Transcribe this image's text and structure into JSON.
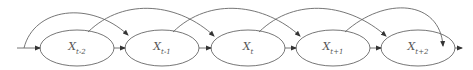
{
  "diagram": {
    "type": "markov-chain-second-order",
    "stroke_color": "#555555",
    "nodes": [
      {
        "id": "x_t_minus_2",
        "base": "X",
        "sub": "t-2",
        "cx": 77,
        "cy": 48
      },
      {
        "id": "x_t_minus_1",
        "base": "X",
        "sub": "t-1",
        "cx": 162,
        "cy": 48
      },
      {
        "id": "x_t",
        "base": "X",
        "sub": "t",
        "cx": 248,
        "cy": 48
      },
      {
        "id": "x_t_plus_1",
        "base": "X",
        "sub": "t+1",
        "cx": 333,
        "cy": 48
      },
      {
        "id": "x_t_plus_2",
        "base": "X",
        "sub": "t+2",
        "cx": 418,
        "cy": 48
      }
    ],
    "edges": [
      {
        "from": "start",
        "to": "x_t_minus_2",
        "kind": "sequential"
      },
      {
        "from": "x_t_minus_2",
        "to": "x_t_minus_1",
        "kind": "sequential"
      },
      {
        "from": "x_t_minus_1",
        "to": "x_t",
        "kind": "sequential"
      },
      {
        "from": "x_t",
        "to": "x_t_plus_1",
        "kind": "sequential"
      },
      {
        "from": "x_t_plus_1",
        "to": "x_t_plus_2",
        "kind": "sequential"
      },
      {
        "from": "x_t_plus_2",
        "to": "end",
        "kind": "sequential"
      },
      {
        "from": "start",
        "to": "x_t_minus_1",
        "kind": "skip"
      },
      {
        "from": "x_t_minus_2",
        "to": "x_t",
        "kind": "skip"
      },
      {
        "from": "x_t_minus_1",
        "to": "x_t_plus_1",
        "kind": "skip"
      },
      {
        "from": "x_t",
        "to": "x_t_plus_2",
        "kind": "skip"
      },
      {
        "from": "x_t_plus_1",
        "to": "end",
        "kind": "skip"
      }
    ]
  }
}
